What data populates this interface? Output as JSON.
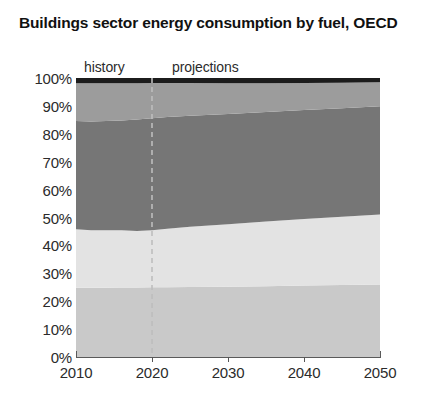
{
  "chart_data": {
    "type": "area",
    "title": "Buildings sector energy consumption by fuel, OECD",
    "subtitle": "",
    "xlabel": "",
    "ylabel": "",
    "xlim": [
      2010,
      2050
    ],
    "ylim": [
      0,
      100
    ],
    "stacked": true,
    "normalized_percent": true,
    "grid": false,
    "legend_position": "none",
    "x_tick_labels": [
      "2010",
      "2020",
      "2030",
      "2040",
      "2050"
    ],
    "x_ticks": [
      2010,
      2020,
      2030,
      2040,
      2050
    ],
    "y_tick_labels": [
      "0%",
      "10%",
      "20%",
      "30%",
      "40%",
      "50%",
      "60%",
      "70%",
      "80%",
      "90%",
      "100%"
    ],
    "y_ticks": [
      0,
      10,
      20,
      30,
      40,
      50,
      60,
      70,
      80,
      90,
      100
    ],
    "annotations": [
      {
        "name": "history",
        "text": "history",
        "x": 2012
      },
      {
        "name": "projections",
        "text": "projections",
        "x": 2024
      },
      {
        "name": "divider",
        "text": "",
        "x": 2020,
        "style": "dashed-vertical"
      }
    ],
    "x": [
      2010,
      2012,
      2014,
      2016,
      2018,
      2020,
      2022,
      2025,
      2030,
      2035,
      2040,
      2045,
      2050
    ],
    "series": [
      {
        "name": "band-1-bottom",
        "color": "#c9c9c9",
        "values": [
          24.8,
          24.8,
          24.8,
          24.9,
          24.9,
          25.0,
          25.0,
          25.1,
          25.2,
          25.4,
          25.6,
          25.8,
          26.0
        ]
      },
      {
        "name": "band-2",
        "color": "#e3e3e3",
        "values": [
          21.0,
          20.6,
          20.6,
          20.5,
          20.3,
          20.4,
          21.0,
          21.6,
          22.4,
          23.2,
          23.9,
          24.5,
          25.1
        ]
      },
      {
        "name": "band-3",
        "color": "#767676",
        "values": [
          38.8,
          39.0,
          39.2,
          39.4,
          39.9,
          40.2,
          40.0,
          39.8,
          39.5,
          39.2,
          39.0,
          38.9,
          38.8
        ]
      },
      {
        "name": "band-4",
        "color": "#9c9c9c",
        "values": [
          13.5,
          13.7,
          13.5,
          13.3,
          13.0,
          12.6,
          12.2,
          11.7,
          11.0,
          10.3,
          9.7,
          9.1,
          8.6
        ]
      },
      {
        "name": "band-5-top",
        "color": "#1c1c1c",
        "values": [
          1.9,
          1.9,
          1.9,
          1.9,
          1.9,
          1.8,
          1.8,
          1.8,
          1.9,
          1.9,
          1.8,
          1.7,
          1.5
        ]
      }
    ],
    "cumulative_upper_bounds": {
      "band-1-bottom": [
        24.8,
        24.8,
        24.8,
        24.9,
        24.9,
        25.0,
        25.0,
        25.1,
        25.2,
        25.4,
        25.6,
        25.8,
        26.0
      ],
      "band-2": [
        45.8,
        45.4,
        45.4,
        45.4,
        45.2,
        45.4,
        46.0,
        46.7,
        47.6,
        48.6,
        49.5,
        50.3,
        51.1
      ],
      "band-3": [
        84.6,
        84.4,
        84.6,
        84.8,
        85.1,
        85.6,
        86.0,
        86.5,
        87.1,
        87.8,
        88.5,
        89.2,
        89.9
      ],
      "band-4": [
        98.1,
        98.1,
        98.1,
        98.1,
        98.1,
        98.2,
        98.2,
        98.2,
        98.1,
        98.1,
        98.2,
        98.3,
        98.5
      ],
      "band-5-top": [
        100,
        100,
        100,
        100,
        100,
        100,
        100,
        100,
        100,
        100,
        100,
        100,
        100
      ]
    }
  },
  "colors": {
    "axis": "#5a5a5a",
    "text": "#2b2b2b",
    "title": "#111111",
    "divider": "#bdbdbd",
    "background": "#ffffff"
  }
}
